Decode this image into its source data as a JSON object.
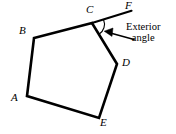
{
  "figure": {
    "type": "geometry-diagram",
    "background_color": "#ffffff",
    "stroke_color": "#000000",
    "stroke_width": 2.6,
    "vertices": [
      {
        "id": "A",
        "label": "A",
        "x": 27,
        "y": 96,
        "label_x": 12,
        "label_y": 93
      },
      {
        "id": "B",
        "label": "B",
        "x": 34,
        "y": 38,
        "label_x": 20,
        "label_y": 26
      },
      {
        "id": "C",
        "label": "C",
        "x": 92,
        "y": 23,
        "label_x": 86,
        "label_y": 5
      },
      {
        "id": "D",
        "label": "D",
        "x": 117,
        "y": 64,
        "label_x": 122,
        "label_y": 58
      },
      {
        "id": "E",
        "label": "E",
        "x": 99,
        "y": 118,
        "label_x": 100,
        "label_y": 117
      },
      {
        "id": "F",
        "label": "F",
        "x": 131,
        "y": 11,
        "label_x": 125,
        "label_y": 1
      }
    ],
    "polygon_path": "27,96 34,38 92,23 117,64 99,118",
    "extension_ray": {
      "from": "C",
      "to": "F",
      "x1": 92,
      "y1": 23,
      "x2": 131,
      "y2": 11
    },
    "angle_arc": {
      "at_vertex": "C",
      "between": [
        "CF",
        "CD"
      ],
      "radius": 12,
      "stroke_width": 1.1
    },
    "pointer_arrow": {
      "from_x": 133,
      "from_y": 39,
      "to_x": 105,
      "to_y": 32,
      "stroke_width": 1.6
    },
    "annotation": {
      "line1": "Exterior",
      "line2": "angle",
      "x": 127,
      "y": 23
    }
  }
}
